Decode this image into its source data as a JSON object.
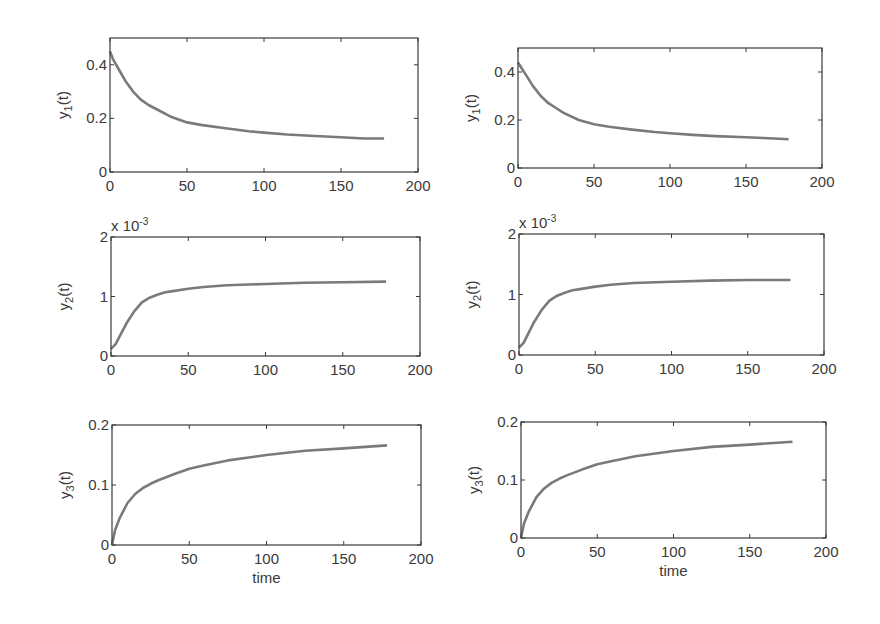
{
  "chart_data": [
    {
      "id": "left-y1",
      "type": "line",
      "column": "left",
      "row": 1,
      "title": "",
      "xlabel": "",
      "ylabel": "y_1(t)",
      "ylabel_main": "y",
      "ylabel_sub": "1",
      "ylabel_tail": "(t)",
      "xlim": [
        0,
        200
      ],
      "ylim": [
        0,
        0.5
      ],
      "grid": false,
      "legend": null,
      "xticks": [
        0,
        50,
        100,
        150,
        200
      ],
      "xtick_labels": [
        "0",
        "50",
        "100",
        "150",
        "200"
      ],
      "yticks": [
        0,
        0.2,
        0.4
      ],
      "ytick_labels": [
        "0",
        "0.2",
        "0.4"
      ],
      "exponent_label": "",
      "box": {
        "x": 110,
        "y": 38,
        "w": 308,
        "h": 134
      },
      "series": [
        {
          "name": "y1",
          "color": "#7a7a7a",
          "x": [
            0,
            2,
            5,
            10,
            15,
            20,
            25,
            30,
            40,
            50,
            60,
            75,
            90,
            100,
            115,
            130,
            150,
            165,
            178
          ],
          "y": [
            0.45,
            0.42,
            0.39,
            0.34,
            0.3,
            0.27,
            0.25,
            0.235,
            0.205,
            0.185,
            0.175,
            0.163,
            0.152,
            0.147,
            0.14,
            0.135,
            0.13,
            0.125,
            0.125
          ]
        }
      ]
    },
    {
      "id": "right-y1",
      "type": "line",
      "column": "right",
      "row": 1,
      "title": "",
      "xlabel": "",
      "ylabel": "y_1(t)",
      "ylabel_main": "y",
      "ylabel_sub": "1",
      "ylabel_tail": "(t)",
      "xlim": [
        0,
        200
      ],
      "ylim": [
        0,
        0.5
      ],
      "grid": false,
      "legend": null,
      "xticks": [
        0,
        50,
        100,
        150,
        200
      ],
      "xtick_labels": [
        "0",
        "50",
        "100",
        "150",
        "200"
      ],
      "yticks": [
        0,
        0.2,
        0.4
      ],
      "ytick_labels": [
        "0",
        "0.2",
        "0.4"
      ],
      "exponent_label": "",
      "box": {
        "x": 518,
        "y": 48,
        "w": 304,
        "h": 120
      },
      "series": [
        {
          "name": "y1",
          "color": "#7a7a7a",
          "x": [
            0,
            2,
            5,
            10,
            15,
            20,
            25,
            30,
            40,
            50,
            60,
            75,
            90,
            100,
            115,
            130,
            150,
            165,
            178
          ],
          "y": [
            0.44,
            0.42,
            0.39,
            0.34,
            0.3,
            0.27,
            0.25,
            0.23,
            0.2,
            0.182,
            0.172,
            0.16,
            0.15,
            0.145,
            0.138,
            0.133,
            0.128,
            0.124,
            0.12
          ]
        }
      ]
    },
    {
      "id": "left-y2",
      "type": "line",
      "column": "left",
      "row": 2,
      "title": "",
      "xlabel": "",
      "ylabel": "y_2(t)",
      "ylabel_main": "y",
      "ylabel_sub": "2",
      "ylabel_tail": "(t)",
      "xlim": [
        0,
        200
      ],
      "ylim": [
        0,
        2
      ],
      "grid": false,
      "legend": null,
      "xticks": [
        0,
        50,
        100,
        150,
        200
      ],
      "xtick_labels": [
        "0",
        "50",
        "100",
        "150",
        "200"
      ],
      "yticks": [
        0,
        1,
        2
      ],
      "ytick_labels": [
        "0",
        "1",
        "2"
      ],
      "exponent_label": "x 10",
      "exponent_power": "-3",
      "box": {
        "x": 111,
        "y": 237,
        "w": 309,
        "h": 119
      },
      "series": [
        {
          "name": "y2",
          "color": "#7a7a7a",
          "x": [
            0,
            3,
            6,
            10,
            15,
            20,
            25,
            30,
            35,
            40,
            50,
            60,
            75,
            100,
            125,
            150,
            178
          ],
          "y": [
            0.12,
            0.2,
            0.35,
            0.55,
            0.75,
            0.9,
            0.98,
            1.03,
            1.07,
            1.09,
            1.13,
            1.16,
            1.19,
            1.21,
            1.23,
            1.24,
            1.25
          ]
        }
      ]
    },
    {
      "id": "right-y2",
      "type": "line",
      "column": "right",
      "row": 2,
      "title": "",
      "xlabel": "",
      "ylabel": "y_2(t)",
      "ylabel_main": "y",
      "ylabel_sub": "2",
      "ylabel_tail": "(t)",
      "xlim": [
        0,
        200
      ],
      "ylim": [
        0,
        2
      ],
      "grid": false,
      "legend": null,
      "xticks": [
        0,
        50,
        100,
        150,
        200
      ],
      "xtick_labels": [
        "0",
        "50",
        "100",
        "150",
        "200"
      ],
      "yticks": [
        0,
        1,
        2
      ],
      "ytick_labels": [
        "0",
        "1",
        "2"
      ],
      "exponent_label": "x 10",
      "exponent_power": "-3",
      "box": {
        "x": 519,
        "y": 234,
        "w": 305,
        "h": 121
      },
      "series": [
        {
          "name": "y2",
          "color": "#7a7a7a",
          "x": [
            0,
            3,
            6,
            10,
            15,
            20,
            25,
            30,
            35,
            40,
            50,
            60,
            75,
            100,
            125,
            150,
            178
          ],
          "y": [
            0.12,
            0.2,
            0.35,
            0.55,
            0.75,
            0.9,
            0.98,
            1.03,
            1.07,
            1.09,
            1.13,
            1.16,
            1.19,
            1.21,
            1.23,
            1.24,
            1.24
          ]
        }
      ]
    },
    {
      "id": "left-y3",
      "type": "line",
      "column": "left",
      "row": 3,
      "title": "",
      "xlabel": "time",
      "ylabel": "y_3(t)",
      "ylabel_main": "y",
      "ylabel_sub": "3",
      "ylabel_tail": "(t)",
      "xlim": [
        0,
        200
      ],
      "ylim": [
        0,
        0.2
      ],
      "grid": false,
      "legend": null,
      "xticks": [
        0,
        50,
        100,
        150,
        200
      ],
      "xtick_labels": [
        "0",
        "50",
        "100",
        "150",
        "200"
      ],
      "yticks": [
        0,
        0.1,
        0.2
      ],
      "ytick_labels": [
        "0",
        "0.1",
        "0.2"
      ],
      "exponent_label": "",
      "box": {
        "x": 112,
        "y": 425,
        "w": 309,
        "h": 120
      },
      "series": [
        {
          "name": "y3",
          "color": "#7a7a7a",
          "x": [
            0,
            2,
            5,
            10,
            15,
            20,
            25,
            30,
            40,
            50,
            60,
            75,
            100,
            125,
            150,
            178
          ],
          "y": [
            0.0,
            0.025,
            0.045,
            0.07,
            0.085,
            0.095,
            0.102,
            0.108,
            0.118,
            0.127,
            0.133,
            0.141,
            0.15,
            0.157,
            0.161,
            0.166
          ]
        }
      ]
    },
    {
      "id": "right-y3",
      "type": "line",
      "column": "right",
      "row": 3,
      "title": "",
      "xlabel": "time",
      "ylabel": "y_3(t)",
      "ylabel_main": "y",
      "ylabel_sub": "3",
      "ylabel_tail": "(t)",
      "xlim": [
        0,
        200
      ],
      "ylim": [
        0,
        0.2
      ],
      "grid": false,
      "legend": null,
      "xticks": [
        0,
        50,
        100,
        150,
        200
      ],
      "xtick_labels": [
        "0",
        "50",
        "100",
        "150",
        "200"
      ],
      "yticks": [
        0,
        0.1,
        0.2
      ],
      "ytick_labels": [
        "0",
        "0.1",
        "0.2"
      ],
      "exponent_label": "",
      "box": {
        "x": 521,
        "y": 422,
        "w": 305,
        "h": 116
      },
      "series": [
        {
          "name": "y3",
          "color": "#7a7a7a",
          "x": [
            0,
            2,
            5,
            10,
            15,
            20,
            25,
            30,
            40,
            50,
            60,
            75,
            100,
            125,
            150,
            178
          ],
          "y": [
            0.0,
            0.025,
            0.045,
            0.07,
            0.085,
            0.095,
            0.102,
            0.108,
            0.118,
            0.127,
            0.133,
            0.141,
            0.15,
            0.157,
            0.161,
            0.166
          ]
        }
      ]
    }
  ]
}
